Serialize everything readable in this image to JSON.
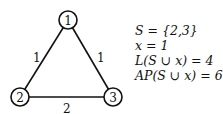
{
  "graph": {
    "nodes": [
      {
        "id": "1",
        "label": "1",
        "x": 68,
        "y": 20
      },
      {
        "id": "2",
        "label": "2",
        "x": 20,
        "y": 97
      },
      {
        "id": "3",
        "label": "3",
        "x": 113,
        "y": 97
      }
    ],
    "edges": [
      {
        "from": "1",
        "to": "2",
        "weight": "1"
      },
      {
        "from": "1",
        "to": "3",
        "weight": "1"
      },
      {
        "from": "2",
        "to": "3",
        "weight": "2"
      }
    ]
  },
  "equations": [
    "S = {2,3}",
    "x = 1",
    "L(S ∪ x) = 4",
    "AP(S ∪ x) = 6"
  ]
}
